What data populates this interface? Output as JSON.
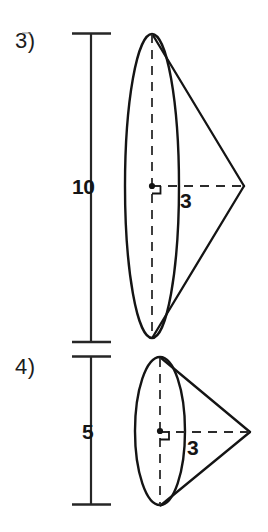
{
  "worksheet": {
    "title": "Cone volume practice problems",
    "background_color": "#ffffff",
    "ink_color": "#1a1a1a"
  },
  "problems": [
    {
      "number": "3)",
      "shape": "cone",
      "height_label": "10",
      "radius_label": "3",
      "right_angle_marker": true,
      "geometry": {
        "base_center": {
          "x": 152,
          "y": 186
        },
        "base_rx": 27,
        "base_ry": 152,
        "apex": {
          "x": 244,
          "y": 186
        },
        "dim_line_x": 91,
        "dim_top_y": 33,
        "dim_bottom_y": 343,
        "dim_tick_x1": 72,
        "dim_tick_x2": 110
      }
    },
    {
      "number": "4)",
      "shape": "cone",
      "height_label": "5",
      "radius_label": "3",
      "right_angle_marker": true,
      "geometry": {
        "base_center": {
          "x": 160,
          "y": 431
        },
        "base_rx": 25,
        "base_ry": 74,
        "apex": {
          "x": 250,
          "y": 432
        },
        "dim_line_x": 91,
        "dim_top_y": 356,
        "dim_bottom_y": 505,
        "dim_tick_x1": 72,
        "dim_tick_x2": 110
      }
    }
  ]
}
